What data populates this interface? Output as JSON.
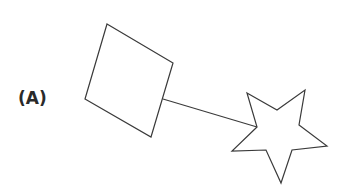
{
  "figure": {
    "label": "(A)",
    "stroke_color": "#3a3a3a",
    "shapes": [
      {
        "type": "square",
        "points": "107,24 173,63 151,137 85,99"
      },
      {
        "type": "line",
        "x1": 163,
        "y1": 99,
        "x2": 257,
        "y2": 127
      },
      {
        "type": "star",
        "points": "247,93 277,110 305,90 299,125 327,146 292,150 281,183 266,150 232,151 257,127"
      }
    ]
  }
}
